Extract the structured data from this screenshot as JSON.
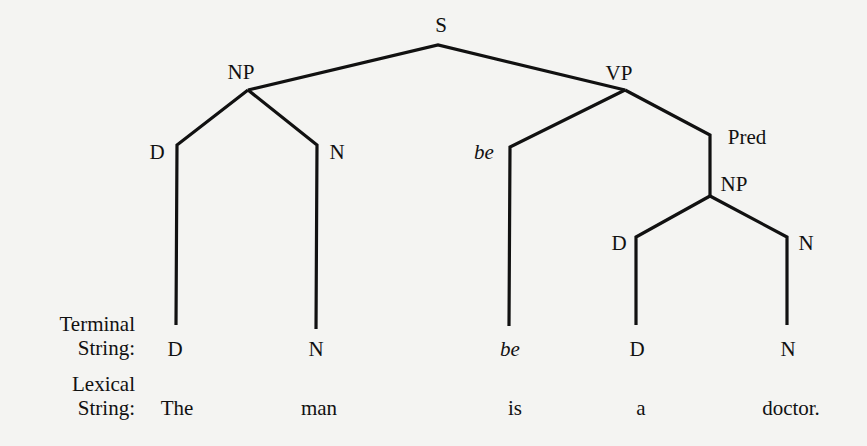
{
  "tree": {
    "root": {
      "label": "S"
    },
    "subject_np": {
      "label": "NP",
      "children": [
        {
          "label": "D"
        },
        {
          "label": "N"
        }
      ]
    },
    "vp": {
      "label": "VP",
      "children": [
        {
          "label": "be",
          "italic": true
        },
        {
          "label": "Pred"
        }
      ]
    },
    "pred_np": {
      "label": "NP",
      "children": [
        {
          "label": "D"
        },
        {
          "label": "N"
        }
      ]
    }
  },
  "rows": {
    "terminal_label_line1": "Terminal",
    "terminal_label_line2": "String:",
    "lexical_label_line1": "Lexical",
    "lexical_label_line2": "String:"
  },
  "terminal_string": [
    "D",
    "N",
    "be",
    "D",
    "N"
  ],
  "lexical_string": [
    "The",
    "man",
    "is",
    "a",
    "doctor."
  ],
  "colors": {
    "ink": "#111111",
    "paper": "#f4f4f2"
  }
}
